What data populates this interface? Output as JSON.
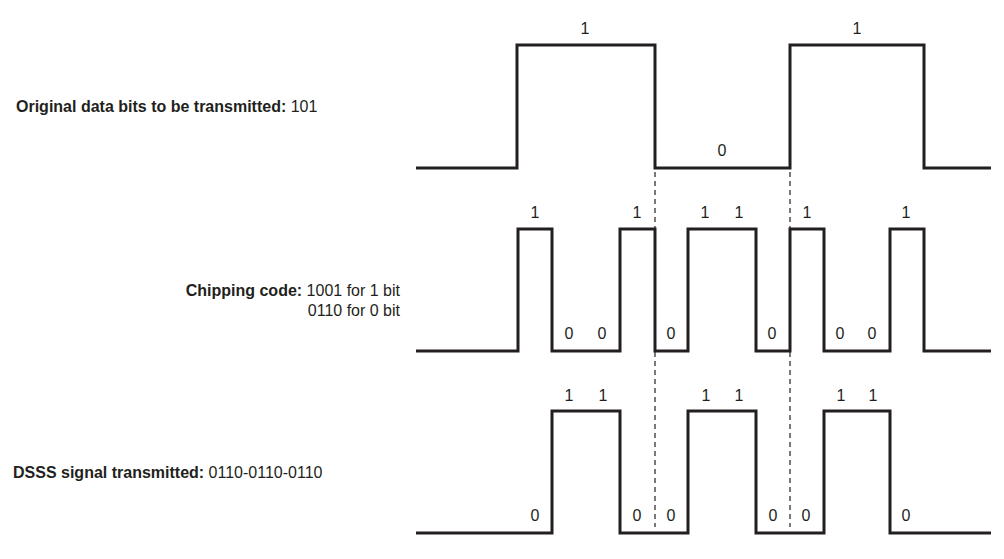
{
  "labels": {
    "data_bits": {
      "title": "Original data bits to be transmitted:",
      "value": "101"
    },
    "chipping": {
      "title": "Chipping code:",
      "line1": "1001 for 1 bit",
      "line2": "0110 for 0 bit"
    },
    "dsss": {
      "title": "DSSS signal transmitted:",
      "value": "0110-0110-0110"
    }
  },
  "chart_data": {
    "type": "waveform",
    "colors": {
      "line": "#231f20",
      "divider": "#231f20"
    },
    "data_bits": [
      "1",
      "0",
      "1"
    ],
    "chipping_codes": {
      "1": "1001",
      "0": "0110"
    },
    "series": [
      {
        "name": "Original data bits",
        "bits": [
          "1",
          "0",
          "1"
        ],
        "baseline_y": 168,
        "high_y": 45,
        "points": [
          [
            416,
            168
          ],
          [
            517,
            168
          ],
          [
            517,
            45
          ],
          [
            655,
            45
          ],
          [
            655,
            168
          ],
          [
            790,
            168
          ],
          [
            790,
            45
          ],
          [
            924,
            45
          ],
          [
            924,
            168
          ],
          [
            991,
            168
          ]
        ],
        "bit_labels": [
          {
            "text": "1",
            "x": 585,
            "y": 34
          },
          {
            "text": "0",
            "x": 722,
            "y": 156
          },
          {
            "text": "1",
            "x": 857,
            "y": 34
          }
        ]
      },
      {
        "name": "Chipping code",
        "chips": [
          "1",
          "0",
          "0",
          "1",
          "0",
          "1",
          "1",
          "0",
          "1",
          "0",
          "0",
          "1"
        ],
        "baseline_y": 351,
        "high_y": 229,
        "points": [
          [
            416,
            351
          ],
          [
            518,
            351
          ],
          [
            518,
            229
          ],
          [
            552,
            229
          ],
          [
            552,
            351
          ],
          [
            620,
            351
          ],
          [
            620,
            229
          ],
          [
            655,
            229
          ],
          [
            655,
            351
          ],
          [
            688,
            351
          ],
          [
            688,
            229
          ],
          [
            756,
            229
          ],
          [
            756,
            351
          ],
          [
            790,
            351
          ],
          [
            790,
            229
          ],
          [
            824,
            229
          ],
          [
            824,
            351
          ],
          [
            890,
            351
          ],
          [
            890,
            229
          ],
          [
            924,
            229
          ],
          [
            924,
            351
          ],
          [
            991,
            351
          ]
        ],
        "bit_labels": [
          {
            "text": "1",
            "x": 535,
            "y": 218
          },
          {
            "text": "0",
            "x": 569,
            "y": 339
          },
          {
            "text": "0",
            "x": 602,
            "y": 339
          },
          {
            "text": "1",
            "x": 637,
            "y": 218
          },
          {
            "text": "0",
            "x": 671,
            "y": 339
          },
          {
            "text": "1",
            "x": 705,
            "y": 218
          },
          {
            "text": "1",
            "x": 739,
            "y": 218
          },
          {
            "text": "0",
            "x": 772,
            "y": 339
          },
          {
            "text": "1",
            "x": 807,
            "y": 218
          },
          {
            "text": "0",
            "x": 840,
            "y": 339
          },
          {
            "text": "0",
            "x": 872,
            "y": 339
          },
          {
            "text": "1",
            "x": 906,
            "y": 218
          }
        ]
      },
      {
        "name": "DSSS signal transmitted",
        "chips": [
          "0",
          "1",
          "1",
          "0",
          "0",
          "1",
          "1",
          "0",
          "0",
          "1",
          "1",
          "0"
        ],
        "baseline_y": 533,
        "high_y": 411,
        "points": [
          [
            416,
            533
          ],
          [
            552,
            533
          ],
          [
            552,
            411
          ],
          [
            620,
            411
          ],
          [
            620,
            533
          ],
          [
            688,
            533
          ],
          [
            688,
            411
          ],
          [
            756,
            411
          ],
          [
            756,
            533
          ],
          [
            824,
            533
          ],
          [
            824,
            411
          ],
          [
            890,
            411
          ],
          [
            890,
            533
          ],
          [
            991,
            533
          ]
        ],
        "bit_labels": [
          {
            "text": "0",
            "x": 535,
            "y": 521
          },
          {
            "text": "1",
            "x": 569,
            "y": 401
          },
          {
            "text": "1",
            "x": 603,
            "y": 401
          },
          {
            "text": "0",
            "x": 637,
            "y": 521
          },
          {
            "text": "0",
            "x": 671,
            "y": 521
          },
          {
            "text": "1",
            "x": 706,
            "y": 401
          },
          {
            "text": "1",
            "x": 739,
            "y": 401
          },
          {
            "text": "0",
            "x": 773,
            "y": 521
          },
          {
            "text": "0",
            "x": 806,
            "y": 521
          },
          {
            "text": "1",
            "x": 841,
            "y": 401
          },
          {
            "text": "1",
            "x": 873,
            "y": 401
          },
          {
            "text": "0",
            "x": 906,
            "y": 521
          }
        ]
      }
    ],
    "dividers": [
      {
        "x": 655,
        "y1": 172,
        "y2": 527
      },
      {
        "x": 790,
        "y1": 172,
        "y2": 527
      }
    ]
  }
}
